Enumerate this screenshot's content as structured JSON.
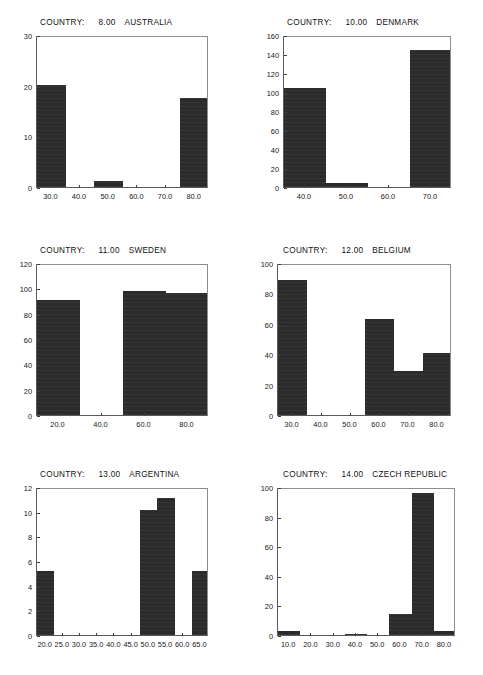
{
  "document": {
    "kind": "histogram-panel-sheet",
    "panel_count": 6
  },
  "labels": {
    "country_prefix": "COUNTRY:"
  },
  "chart_data": [
    {
      "type": "bar",
      "title": "COUNTRY:    8.00   AUSTRALIA",
      "country_label": "COUNTRY:",
      "country_code": "8.00",
      "country_name": "AUSTRALIA",
      "xlabel": "",
      "ylabel": "",
      "xlim": [
        25,
        85
      ],
      "ylim": [
        0,
        30
      ],
      "xticks": [
        "30.0",
        "40.0",
        "50.0",
        "60.0",
        "70.0",
        "80.0"
      ],
      "xtick_values": [
        30,
        40,
        50,
        60,
        70,
        80
      ],
      "yticks": [
        "0",
        "10",
        "20",
        "30"
      ],
      "ytick_values": [
        0,
        10,
        20,
        30
      ],
      "grid": false,
      "legend": "none",
      "bins": [
        {
          "start": 25,
          "end": 35,
          "value": 20.2
        },
        {
          "start": 45,
          "end": 55,
          "value": 1.1
        },
        {
          "start": 75,
          "end": 85,
          "value": 17.6
        }
      ]
    },
    {
      "type": "bar",
      "title": "COUNTRY:   10.00   DENMARK",
      "country_label": "COUNTRY:",
      "country_code": "10.00",
      "country_name": "DENMARK",
      "xlabel": "",
      "ylabel": "",
      "xlim": [
        35,
        75
      ],
      "ylim": [
        0,
        160
      ],
      "xticks": [
        "40.0",
        "50.0",
        "60.0",
        "70.0"
      ],
      "xtick_values": [
        40,
        50,
        60,
        70
      ],
      "yticks": [
        "0",
        "20",
        "40",
        "60",
        "80",
        "100",
        "120",
        "140",
        "160"
      ],
      "ytick_values": [
        0,
        20,
        40,
        60,
        80,
        100,
        120,
        140,
        160
      ],
      "grid": false,
      "legend": "none",
      "bins": [
        {
          "start": 35,
          "end": 45,
          "value": 104
        },
        {
          "start": 45,
          "end": 55,
          "value": 4
        },
        {
          "start": 65,
          "end": 75,
          "value": 144
        }
      ]
    },
    {
      "type": "bar",
      "title": "COUNTRY:   11.00   SWEDEN",
      "country_label": "COUNTRY:",
      "country_code": "11.00",
      "country_name": "SWEDEN",
      "xlabel": "",
      "ylabel": "",
      "xlim": [
        10,
        90
      ],
      "ylim": [
        0,
        120
      ],
      "xticks": [
        "20.0",
        "40.0",
        "60.0",
        "80.0"
      ],
      "xtick_values": [
        20,
        40,
        60,
        80
      ],
      "yticks": [
        "0",
        "20",
        "40",
        "60",
        "80",
        "100",
        "120"
      ],
      "ytick_values": [
        0,
        20,
        40,
        60,
        80,
        100,
        120
      ],
      "grid": false,
      "legend": "none",
      "bins": [
        {
          "start": 10,
          "end": 30,
          "value": 91
        },
        {
          "start": 50,
          "end": 70,
          "value": 98
        },
        {
          "start": 70,
          "end": 90,
          "value": 96
        }
      ]
    },
    {
      "type": "bar",
      "title": "COUNTRY:   12.00   BELGIUM",
      "country_label": "COUNTRY:",
      "country_code": "12.00",
      "country_name": "BELGIUM",
      "xlabel": "",
      "ylabel": "",
      "xlim": [
        25,
        85
      ],
      "ylim": [
        0,
        100
      ],
      "xticks": [
        "30.0",
        "40.0",
        "50.0",
        "60.0",
        "70.0",
        "80.0"
      ],
      "xtick_values": [
        30,
        40,
        50,
        60,
        70,
        80
      ],
      "yticks": [
        "0",
        "20",
        "40",
        "60",
        "80",
        "100"
      ],
      "ytick_values": [
        0,
        20,
        40,
        60,
        80,
        100
      ],
      "grid": false,
      "legend": "none",
      "bins": [
        {
          "start": 25,
          "end": 35,
          "value": 89
        },
        {
          "start": 55,
          "end": 65,
          "value": 63
        },
        {
          "start": 65,
          "end": 75,
          "value": 29
        },
        {
          "start": 75,
          "end": 85,
          "value": 41
        }
      ]
    },
    {
      "type": "bar",
      "title": "COUNTRY:   13.00   ARGENTINA",
      "country_label": "COUNTRY:",
      "country_code": "13.00",
      "country_name": "ARGENTINA",
      "xlabel": "",
      "ylabel": "",
      "xlim": [
        17.5,
        67.5
      ],
      "ylim": [
        0,
        12
      ],
      "xticks": [
        "20.0",
        "25.0",
        "30.0",
        "35.0",
        "40.0",
        "45.0",
        "50.0",
        "55.0",
        "60.0",
        "65.0"
      ],
      "xtick_values": [
        20,
        25,
        30,
        35,
        40,
        45,
        50,
        55,
        60,
        65
      ],
      "yticks": [
        "0",
        "2",
        "4",
        "6",
        "8",
        "10",
        "12"
      ],
      "ytick_values": [
        0,
        2,
        4,
        6,
        8,
        10,
        12
      ],
      "grid": false,
      "legend": "none",
      "bins": [
        {
          "start": 17.5,
          "end": 22.5,
          "value": 5.2
        },
        {
          "start": 47.5,
          "end": 52.5,
          "value": 10.1
        },
        {
          "start": 52.5,
          "end": 57.5,
          "value": 11.1
        },
        {
          "start": 62.5,
          "end": 67.5,
          "value": 5.2
        }
      ]
    },
    {
      "type": "bar",
      "title": "COUNTRY:   14.00   CZECH REPUBLIC",
      "country_label": "COUNTRY:",
      "country_code": "14.00",
      "country_name": "CZECH REPUBLIC",
      "xlabel": "",
      "ylabel": "",
      "xlim": [
        5,
        85
      ],
      "ylim": [
        0,
        100
      ],
      "xticks": [
        "10.0",
        "20.0",
        "30.0",
        "40.0",
        "50.0",
        "60.0",
        "70.0",
        "80.0"
      ],
      "xtick_values": [
        10,
        20,
        30,
        40,
        50,
        60,
        70,
        80
      ],
      "yticks": [
        "0",
        "20",
        "40",
        "60",
        "80",
        "100"
      ],
      "ytick_values": [
        0,
        20,
        40,
        60,
        80,
        100
      ],
      "grid": false,
      "legend": "none",
      "bins": [
        {
          "start": 5,
          "end": 15,
          "value": 3.0
        },
        {
          "start": 35,
          "end": 45,
          "value": 1.0
        },
        {
          "start": 55,
          "end": 65,
          "value": 14.5
        },
        {
          "start": 65,
          "end": 75,
          "value": 96.0
        },
        {
          "start": 75,
          "end": 85,
          "value": 2.5
        }
      ]
    }
  ],
  "colors": {
    "bar_fill": "#2b2b2b",
    "axis": "#5a5a5a",
    "frame": "#8d8d8d",
    "text": "#161616",
    "background": "#ffffff"
  }
}
